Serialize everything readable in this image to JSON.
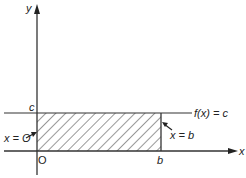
{
  "diagram": {
    "type": "area-under-constant-function",
    "axes": {
      "x_label": "x",
      "y_label": "y",
      "origin_label": "O"
    },
    "function_label": "f(x) = c",
    "y_intercept_label": "c",
    "x_tick_label": "b",
    "left_boundary_label": "x = O",
    "right_boundary_label": "x = b",
    "region": "shaded rectangle from x = 0 to x = b under f(x) = c",
    "colors": {
      "line": "#333333",
      "background": "#ffffff"
    }
  }
}
